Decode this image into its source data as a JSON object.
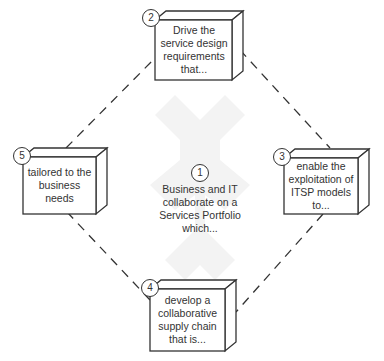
{
  "diagram": {
    "type": "cycle",
    "center": {
      "number": "1",
      "text": "Business and IT collaborate on a Services Portfolio which..."
    },
    "nodes": [
      {
        "number": "2",
        "text": "Drive the service design requirements that..."
      },
      {
        "number": "3",
        "text": "enable the exploitation of ITSP models to..."
      },
      {
        "number": "4",
        "text": "develop a collaborative supply chain that is..."
      },
      {
        "number": "5",
        "text": "tailored to the business needs"
      }
    ],
    "connectors": [
      {
        "from": "2",
        "to": "3",
        "style": "dashed"
      },
      {
        "from": "3",
        "to": "4",
        "style": "dashed"
      },
      {
        "from": "4",
        "to": "5",
        "style": "dashed"
      },
      {
        "from": "5",
        "to": "2",
        "style": "dashed"
      }
    ],
    "colors": {
      "stroke": "#333333",
      "background": "#ffffff",
      "watermark": "#f2f2f2"
    }
  }
}
